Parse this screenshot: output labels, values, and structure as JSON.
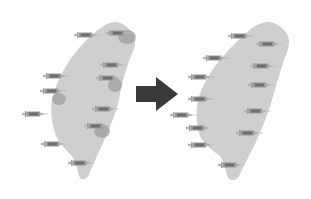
{
  "figure": {
    "colors": {
      "background": "#ffffff",
      "island": "#cfcfcf",
      "patch": "#9a9a9a",
      "arrow": "#3a3a3a",
      "syringe": "#8c8c8c"
    },
    "left_panel": {
      "label": "before",
      "syringes": [
        {
          "x": 86,
          "y": 35
        },
        {
          "x": 118,
          "y": 33
        },
        {
          "x": 112,
          "y": 65
        },
        {
          "x": 55,
          "y": 76
        },
        {
          "x": 108,
          "y": 78
        },
        {
          "x": 52,
          "y": 91
        },
        {
          "x": 34,
          "y": 114
        },
        {
          "x": 104,
          "y": 109
        },
        {
          "x": 96,
          "y": 126
        },
        {
          "x": 53,
          "y": 144
        },
        {
          "x": 80,
          "y": 163
        }
      ],
      "patches": [
        {
          "x": 118,
          "y": 30,
          "w": 18,
          "h": 14
        },
        {
          "x": 108,
          "y": 78,
          "w": 14,
          "h": 14
        },
        {
          "x": 52,
          "y": 93,
          "w": 14,
          "h": 12
        },
        {
          "x": 94,
          "y": 124,
          "w": 16,
          "h": 14
        }
      ]
    },
    "arrow": {
      "direction": "right"
    },
    "right_panel": {
      "label": "after",
      "syringes": [
        {
          "x": 240,
          "y": 36
        },
        {
          "x": 268,
          "y": 44
        },
        {
          "x": 215,
          "y": 58
        },
        {
          "x": 262,
          "y": 66
        },
        {
          "x": 200,
          "y": 77
        },
        {
          "x": 260,
          "y": 85
        },
        {
          "x": 200,
          "y": 99
        },
        {
          "x": 256,
          "y": 111
        },
        {
          "x": 182,
          "y": 115
        },
        {
          "x": 198,
          "y": 128
        },
        {
          "x": 248,
          "y": 133
        },
        {
          "x": 200,
          "y": 145
        },
        {
          "x": 230,
          "y": 165
        }
      ]
    }
  }
}
